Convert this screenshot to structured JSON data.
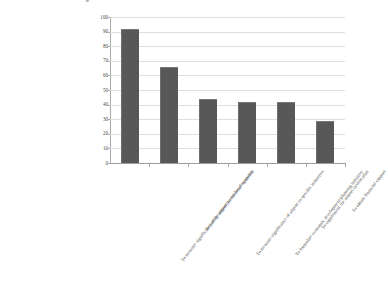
{
  "chart_data": {
    "type": "bar",
    "title": "",
    "subtitle": "",
    "xlabel": "",
    "ylabel": "Share of responses (%)",
    "ylim": [
      0,
      100
    ],
    "ytick_step": 10,
    "yticks": [
      100,
      90,
      80,
      70,
      60,
      50,
      40,
      30,
      20,
      10,
      0
    ],
    "grid": "horizontal",
    "legend": "none",
    "bar_color": "#585858",
    "gridline_color": "#dedede",
    "axis_color": "#a9a9a9",
    "categories": [
      "To measure significance of the airport to the local economy",
      "To justify airport investment/expansion",
      "To measure significance of airport to specific industries",
      "To formulate economic development/planning initiative",
      "To supplement the airport system plan",
      "To obtain financial support"
    ],
    "values": [
      92,
      66,
      44,
      42,
      42,
      29
    ]
  }
}
